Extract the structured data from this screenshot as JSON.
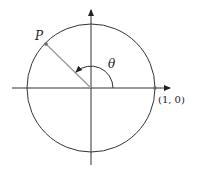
{
  "diagram": {
    "type": "unit-circle",
    "labels": {
      "point_p": "P",
      "angle": "θ",
      "point_unit": "(1, 0)"
    },
    "colors": {
      "stroke": "#333333",
      "radius_line": "#9a9a9a",
      "background": "#ffffff"
    }
  }
}
